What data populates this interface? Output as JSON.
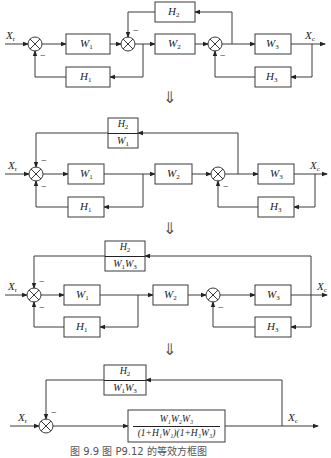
{
  "figure": {
    "caption": "图 9.9   图 P9.12 的等效方框图",
    "transform_arrow": "⇓"
  },
  "diagrams": [
    {
      "input": "X",
      "input_sub": "r",
      "output": "X",
      "output_sub": "c",
      "blocks": {
        "W1": {
          "sym": "W",
          "sub": "1"
        },
        "W2": {
          "sym": "W",
          "sub": "2"
        },
        "W3": {
          "sym": "W",
          "sub": "3"
        },
        "H1": {
          "sym": "H",
          "sub": "1"
        },
        "H2": {
          "sym": "H",
          "sub": "2"
        },
        "H3": {
          "sym": "H",
          "sub": "3"
        }
      },
      "signs": {
        "minus": "−"
      }
    },
    {
      "input": "X",
      "input_sub": "r",
      "output": "X",
      "output_sub": "c",
      "blocks": {
        "W1": {
          "sym": "W",
          "sub": "1"
        },
        "W2": {
          "sym": "W",
          "sub": "2"
        },
        "W3": {
          "sym": "W",
          "sub": "3"
        },
        "H1": {
          "sym": "H",
          "sub": "1"
        },
        "H3": {
          "sym": "H",
          "sub": "3"
        },
        "feedback": {
          "num_sym": "H",
          "num_sub": "2",
          "den1_sym": "W",
          "den1_sub": "1"
        }
      },
      "signs": {
        "minus": "−"
      }
    },
    {
      "input": "X",
      "input_sub": "r",
      "output": "X",
      "output_sub": "c",
      "blocks": {
        "W1": {
          "sym": "W",
          "sub": "1"
        },
        "W2": {
          "sym": "W",
          "sub": "2"
        },
        "W3": {
          "sym": "W",
          "sub": "3"
        },
        "H1": {
          "sym": "H",
          "sub": "1"
        },
        "H3": {
          "sym": "H",
          "sub": "3"
        },
        "feedback": {
          "num_sym": "H",
          "num_sub": "2",
          "den1_sym": "W",
          "den1_sub": "1",
          "den2_sym": "W",
          "den2_sub": "3"
        }
      },
      "signs": {
        "minus": "−"
      }
    },
    {
      "input": "X",
      "input_sub": "r",
      "output": "X",
      "output_sub": "c",
      "blocks": {
        "feedback": {
          "num_sym": "H",
          "num_sub": "2",
          "den1_sym": "W",
          "den1_sub": "1",
          "den2_sym": "W",
          "den2_sub": "3"
        },
        "forward": {
          "numerator": "W₁W₂W₃",
          "denominator": "(1+H₁W₁)(1+H₃W₃)"
        }
      },
      "signs": {
        "minus": "−"
      }
    }
  ]
}
